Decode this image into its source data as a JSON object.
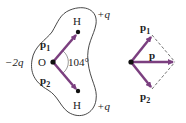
{
  "figure": {
    "left": {
      "title": "water-molecule",
      "oxygen": {
        "label": "O",
        "charge": "−2q"
      },
      "hydrogen_top": {
        "label": "H",
        "charge": "+q"
      },
      "hydrogen_bottom": {
        "label": "H",
        "charge": "+q"
      },
      "dipole_1": {
        "symbol": "p",
        "subscript": "1"
      },
      "dipole_2": {
        "symbol": "p",
        "subscript": "2"
      },
      "angle": "104°"
    },
    "right": {
      "title": "vector-sum",
      "dipole_1": {
        "symbol": "p",
        "subscript": "1"
      },
      "dipole_2": {
        "symbol": "p",
        "subscript": "2"
      },
      "resultant": {
        "symbol": "p"
      }
    },
    "colors": {
      "vector": "#7b3f7f",
      "outline": "#333333",
      "text": "#222222"
    }
  }
}
